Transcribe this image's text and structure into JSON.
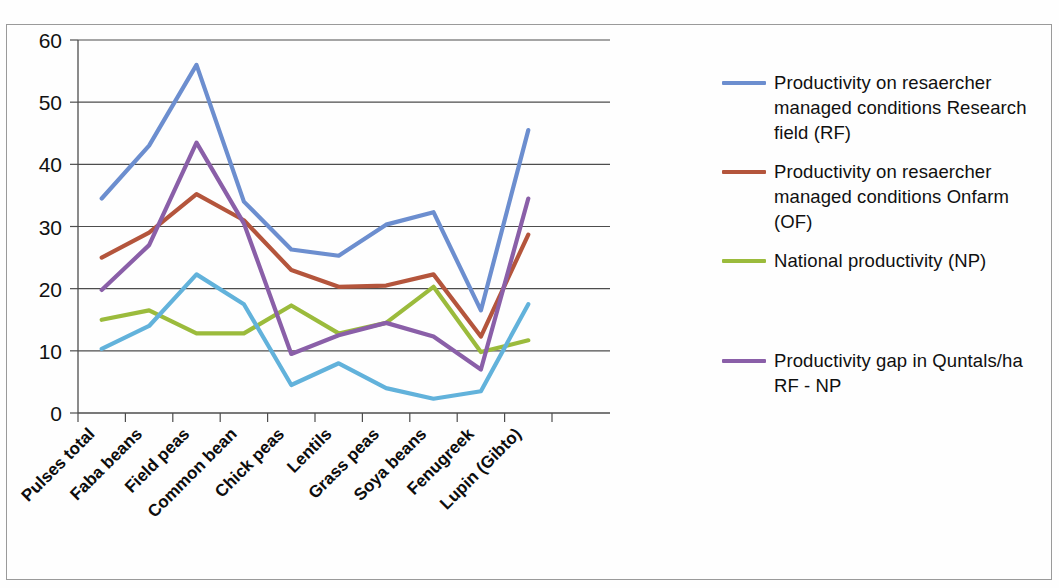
{
  "chart_data": {
    "type": "line",
    "title": "",
    "xlabel": "",
    "ylabel": "",
    "ylim": [
      0,
      60
    ],
    "yticks": [
      "0",
      "10",
      "20",
      "30",
      "40",
      "50",
      "60"
    ],
    "grid": "horizontal",
    "legend_position": "right",
    "categories": [
      "Pulses total",
      "Faba beans",
      "Field peas",
      "Common bean",
      "Chick peas",
      "Lentils",
      "Grass peas",
      "Soya beans",
      "Fenugreek",
      "Lupin (Gibto)"
    ],
    "series": [
      {
        "name": "Productivity on resaercher managed conditions Research field (RF)",
        "color": "#6c8ecf",
        "values": [
          34.5,
          43.0,
          56.0,
          34.0,
          26.3,
          25.3,
          30.3,
          32.3,
          16.5,
          45.5
        ]
      },
      {
        "name": "Productivity on resaercher managed conditions  Onfarm (OF)",
        "color": "#b4553c",
        "values": [
          25.0,
          29.0,
          35.2,
          31.0,
          23.0,
          20.3,
          20.5,
          22.3,
          12.3,
          28.7
        ]
      },
      {
        "name": "National productivity (NP)",
        "color": "#9bbb3c",
        "values": [
          15.0,
          16.5,
          12.8,
          12.8,
          17.3,
          12.8,
          14.5,
          20.3,
          9.8,
          11.7
        ]
      },
      {
        "name": "",
        "color": "#62b2db",
        "values": [
          10.3,
          14.0,
          22.3,
          17.5,
          4.5,
          8.0,
          4.0,
          2.3,
          3.5,
          17.5
        ]
      },
      {
        "name": "Productivity gap in Quntals/ha RF - NP",
        "color": "#8a5fa8",
        "values": [
          19.8,
          27.0,
          43.5,
          30.5,
          9.5,
          12.5,
          14.5,
          12.3,
          7.0,
          34.5
        ]
      }
    ]
  },
  "legend": {
    "items": [
      {
        "label": "Productivity on resaercher managed conditions Research field (RF)",
        "color": "#6c8ecf"
      },
      {
        "label": "Productivity on resaercher managed conditions  Onfarm (OF)",
        "color": "#b4553c"
      },
      {
        "label": "National productivity (NP)",
        "color": "#9bbb3c"
      },
      {
        "label": "",
        "color": "#62b2db"
      },
      {
        "label": "Productivity gap in Quntals/ha RF - NP",
        "color": "#8a5fa8"
      }
    ]
  },
  "axis": {
    "y_ticks": [
      "60",
      "50",
      "40",
      "30",
      "20",
      "10",
      "0"
    ]
  }
}
